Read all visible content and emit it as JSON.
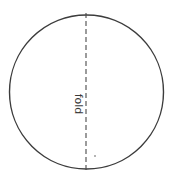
{
  "diagram": {
    "title": "",
    "circle": {
      "cx": 86.5,
      "cy": 92,
      "r": 77,
      "stroke": "#3c3c3c"
    },
    "fold_line": {
      "x": 86,
      "y1": 13,
      "y2": 171,
      "style": "dashed",
      "stroke": "#4a4a4a"
    },
    "label": {
      "text": "fold",
      "rotation_deg": 90
    },
    "dot": {
      "x": 95,
      "y": 156
    }
  }
}
